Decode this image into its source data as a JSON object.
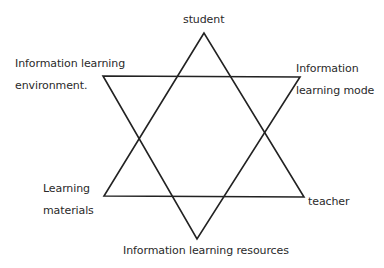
{
  "diagram": {
    "type": "hexagram",
    "stroke_color": "#222222",
    "text_color": "#2a2a2a",
    "up_triangle": {
      "points": [
        [
          204,
          33
        ],
        [
          104,
          196
        ],
        [
          304,
          197
        ]
      ]
    },
    "down_triangle": {
      "points": [
        [
          103,
          76
        ],
        [
          300,
          77
        ],
        [
          197,
          239
        ]
      ]
    },
    "labels": {
      "top": {
        "lines": [
          "student"
        ]
      },
      "upper_left": {
        "lines": [
          "Information learning",
          "environment."
        ]
      },
      "upper_right": {
        "lines": [
          "Information",
          "learning mode"
        ]
      },
      "lower_left": {
        "lines": [
          "Learning",
          "materials"
        ]
      },
      "lower_right": {
        "lines": [
          "teacher"
        ]
      },
      "bottom": {
        "lines": [
          "Information learning resources"
        ]
      }
    }
  }
}
